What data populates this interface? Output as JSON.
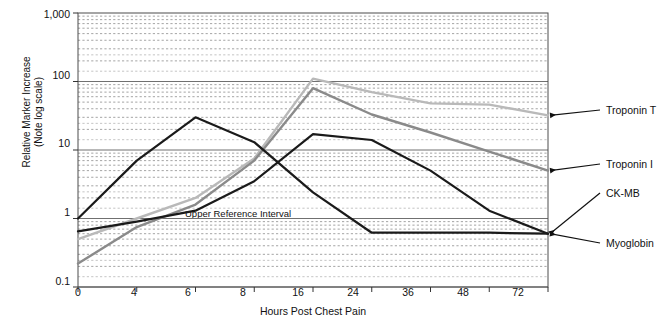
{
  "chart_data": {
    "type": "line",
    "title": "",
    "xlabel": "Hours Post Chest Pain",
    "ylabel": "Relative Marker Increase\n(Note log scale)",
    "x_ticklabels": [
      "0",
      "4",
      "6",
      "8",
      "16",
      "24",
      "36",
      "48",
      "72"
    ],
    "x_values": [
      0,
      4,
      6,
      8,
      16,
      24,
      36,
      48,
      72
    ],
    "x_axis_type": "ordinal-evenly-spaced",
    "y_ticklabels": [
      "1,000",
      "100",
      "10",
      "1",
      "0.1"
    ],
    "y_tickvalues": [
      1000,
      100,
      10,
      1,
      0.1
    ],
    "ylim": [
      0.1,
      1000
    ],
    "yscale": "log",
    "grid": "log-minor-dashed-horizontal",
    "legend_position": "right-with-leader-arrows",
    "annotations": [
      {
        "text": "Upper Reference Interval",
        "y_value": 1,
        "x_category": "8"
      }
    ],
    "series": [
      {
        "name": "Troponin T",
        "color": "#b9b9b9",
        "label_color": "#111111",
        "values": [
          0.5,
          1.0,
          2.0,
          7.5,
          110,
          70,
          48,
          46,
          32
        ]
      },
      {
        "name": "Troponin I",
        "color": "#8a8a8a",
        "label_color": "#111111",
        "values": [
          0.22,
          0.75,
          1.6,
          7.0,
          80,
          33,
          18,
          9.5,
          5.0
        ]
      },
      {
        "name": "CK-MB",
        "color": "#1a1a1a",
        "label_color": "#111111",
        "values": [
          0.65,
          0.9,
          1.3,
          3.5,
          17,
          14,
          5.0,
          1.3,
          0.6
        ]
      },
      {
        "name": "Myoglobin",
        "color": "#1a1a1a",
        "label_color": "#111111",
        "values": [
          1.0,
          7.0,
          30,
          13,
          2.4,
          0.62,
          0.62,
          0.62,
          0.6
        ]
      }
    ]
  },
  "legend": {
    "items": [
      {
        "label": "Troponin T"
      },
      {
        "label": "Troponin I"
      },
      {
        "label": "CK-MB"
      },
      {
        "label": "Myoglobin"
      }
    ]
  },
  "axes": {
    "y_title": "Relative Marker Increase\n(Note log scale)",
    "x_title": "Hours Post Chest Pain"
  },
  "annotation": {
    "upper_reference_interval": "Upper Reference Interval"
  }
}
